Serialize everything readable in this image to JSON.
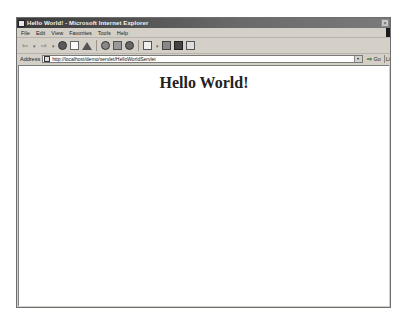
{
  "window": {
    "title": "Hello World! - Microsoft Internet Explorer",
    "close_glyph": "×"
  },
  "menubar": {
    "items": [
      {
        "label": "File"
      },
      {
        "label": "Edit"
      },
      {
        "label": "View"
      },
      {
        "label": "Favorites"
      },
      {
        "label": "Tools"
      },
      {
        "label": "Help"
      }
    ]
  },
  "toolbar": {
    "back_glyph": "⇦",
    "forward_glyph": "⇨",
    "dropdown_glyph": "▾",
    "buttons": [
      "back-icon",
      "forward-icon",
      "stop-icon",
      "refresh-icon",
      "home-icon",
      "search-icon",
      "favorites-icon",
      "history-icon",
      "mail-icon",
      "print-icon",
      "edit-icon",
      "discuss-icon"
    ]
  },
  "addressbar": {
    "label": "Address",
    "url": "http://localhost/demo/servlet/HelloWorldServlet",
    "dropdown_glyph": "▾",
    "go_arrow": "⇨",
    "go_label": "Go",
    "links_label": "Li"
  },
  "page": {
    "heading": "Hello World!"
  }
}
